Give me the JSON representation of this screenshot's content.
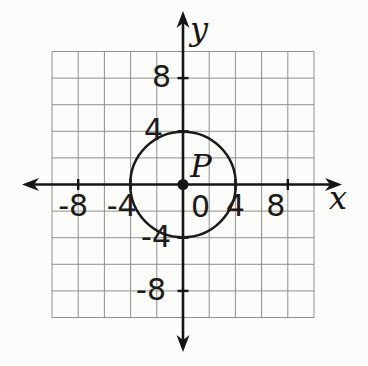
{
  "figure": {
    "x_axis_label": "x",
    "y_axis_label": "y",
    "origin_label": "0",
    "point_label": "P",
    "x_tick_values": [
      -8,
      -4,
      4,
      8
    ],
    "x_tick_labels": [
      "-8",
      "-4",
      "4",
      "8"
    ],
    "y_tick_values": [
      8,
      4,
      -4,
      -8
    ],
    "y_tick_labels": [
      "8",
      "4",
      "-4",
      "-8"
    ],
    "x_range": [
      -10,
      10
    ],
    "y_range": [
      -10,
      10
    ],
    "grid_step": 2,
    "circle": {
      "center_label": "P",
      "center_x": 0,
      "center_y": 0,
      "radius": 4
    },
    "colors": {
      "axis": "#151515",
      "grid": "#8f8f8f",
      "circle": "#1a1a1a",
      "label": "#1b1b1b",
      "background": "#fcfcfa"
    }
  }
}
